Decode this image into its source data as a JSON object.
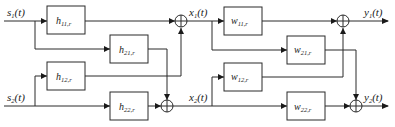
{
  "diagram": {
    "type": "mixing-demixing-block-diagram",
    "inputs": [
      {
        "id": "s1",
        "base": "s",
        "sub": "1",
        "suffix": "(t)"
      },
      {
        "id": "s2",
        "base": "s",
        "sub": "2",
        "suffix": "(t)"
      }
    ],
    "mixed": [
      {
        "id": "x1",
        "base": "x",
        "sub": "1",
        "suffix": "(t)"
      },
      {
        "id": "x2",
        "base": "x",
        "sub": "2",
        "suffix": "(t)"
      }
    ],
    "outputs": [
      {
        "id": "y1",
        "base": "y",
        "sub": "1",
        "suffix": "(t)"
      },
      {
        "id": "y2",
        "base": "y",
        "sub": "2",
        "suffix": "(t)"
      }
    ],
    "mixing_blocks": [
      {
        "id": "h11",
        "base": "h",
        "sub": "11,r"
      },
      {
        "id": "h21",
        "base": "h",
        "sub": "21,r"
      },
      {
        "id": "h12",
        "base": "h",
        "sub": "12,r"
      },
      {
        "id": "h22",
        "base": "h",
        "sub": "22,r"
      }
    ],
    "demixing_blocks": [
      {
        "id": "w11",
        "base": "w",
        "sub": "11,r"
      },
      {
        "id": "w21",
        "base": "w",
        "sub": "21,r"
      },
      {
        "id": "w12",
        "base": "w",
        "sub": "12,r"
      },
      {
        "id": "w22",
        "base": "w",
        "sub": "22,r"
      }
    ],
    "summing_junctions": [
      "sum-x1",
      "sum-x2",
      "sum-y1",
      "sum-y2"
    ],
    "connections": [
      "s1 -> h11 -> sum-x1",
      "s1 -> h21 -> sum-x2",
      "s2 -> h12 -> sum-x1",
      "s2 -> h22 -> sum-x2",
      "x1 -> w11 -> sum-y1",
      "x1 -> w21 -> sum-y2",
      "x2 -> w12 -> sum-y1",
      "x2 -> w22 -> sum-y2"
    ]
  }
}
